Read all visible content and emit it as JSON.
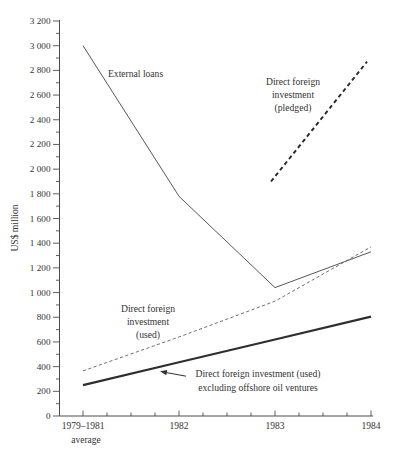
{
  "figure": {
    "y_axis_title": "US$ million",
    "x_tick_labels": [
      "1979–1981",
      "1982",
      "1983",
      "1984"
    ],
    "x_first_sub_label": "average",
    "y_tick_labels": [
      "0",
      "200",
      "400",
      "600",
      "800",
      "1 000",
      "1 200",
      "1 400",
      "1 600",
      "1 800",
      "2 000",
      "2 200",
      "2 400",
      "2 600",
      "2 800",
      "3 000",
      "3 200"
    ],
    "annotations": {
      "external_loans": "External loans",
      "pledged": [
        "Direct foreign",
        "investment",
        "(pledged)"
      ],
      "used": [
        "Direct foreign",
        "investment",
        "(used)"
      ],
      "excl_line1": "Direct foreign investment (used)",
      "excl_line2": "excluding offshore oil ventures"
    },
    "colors": {
      "ink": "#333333",
      "axis": "#4d4d4d",
      "line_thin": "#575757",
      "line_dashed_thin": "#606060",
      "line_dashed_bold": "#262626",
      "line_thick": "#2e2e2e"
    }
  },
  "chart_data": {
    "type": "line",
    "title": "",
    "xlabel": "",
    "ylabel": "US$ million",
    "categories": [
      "1979–1981 average",
      "1982",
      "1983",
      "1984"
    ],
    "ylim": [
      0,
      3200
    ],
    "y_tick_step": 200,
    "y_minor_tick_step": 100,
    "x_minor_ticks_between_years": 3,
    "grid": false,
    "legend_position": "none (direct labels on lines)",
    "series": [
      {
        "name": "External loans",
        "x": [
          0,
          1,
          2,
          3
        ],
        "values": [
          3000,
          1780,
          1040,
          1330
        ],
        "style": "solid-thin"
      },
      {
        "name": "Direct foreign investment (pledged)",
        "x": [
          2,
          3
        ],
        "values": [
          1900,
          2870
        ],
        "style": "dashed-bold"
      },
      {
        "name": "Direct foreign investment (used)",
        "x": [
          0,
          1,
          2,
          3
        ],
        "values": [
          365,
          640,
          930,
          1370
        ],
        "style": "dashed-thin"
      },
      {
        "name": "Direct foreign investment (used) excluding offshore oil ventures",
        "x": [
          0,
          1,
          2,
          3
        ],
        "values": [
          250,
          435,
          620,
          805
        ],
        "style": "solid-thick"
      }
    ]
  }
}
